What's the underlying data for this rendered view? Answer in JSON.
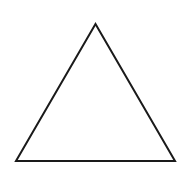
{
  "diagram": {
    "shape": "equilateral-triangle",
    "fill": "#ffffff",
    "stroke": "#1a1a1a",
    "stroke_width": 2,
    "vertices": {
      "apex": [
        95.5,
        24
      ],
      "bottom_left": [
        16,
        161
      ],
      "bottom_right": [
        175,
        161
      ]
    }
  }
}
